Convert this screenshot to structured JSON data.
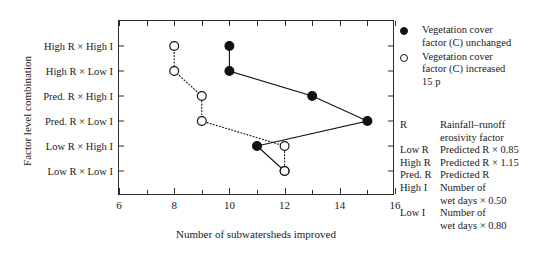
{
  "chart_data": {
    "type": "scatter",
    "title": "",
    "xlabel": "Number of subwatersheds improved",
    "ylabel": "Factor level combination",
    "xlim": [
      6,
      16
    ],
    "xticks": [
      6,
      8,
      10,
      12,
      14,
      16
    ],
    "xtick_labels": [
      "6",
      "8",
      "10",
      "12",
      "14",
      "16"
    ],
    "xminor_step": 1,
    "grid": false,
    "legend_position": "right",
    "categories": [
      "High R × High I",
      "High R × Low I",
      "Pred. R × High I",
      "Pred. R × Low I",
      "Low R × High I",
      "Low R × Low I"
    ],
    "series": [
      {
        "name": "Vegetation cover factor (C) unchanged",
        "marker": "filled-circle",
        "line": "solid",
        "color": "#111111",
        "values": [
          10,
          10,
          13,
          15,
          11,
          12
        ]
      },
      {
        "name": "Vegetation cover factor (C) increased 15 p",
        "marker": "open-circle",
        "line": "dotted",
        "color": "#111111",
        "values": [
          8,
          8,
          9,
          9,
          12,
          12
        ]
      }
    ]
  },
  "axes": {
    "y_title": "Factor level combination",
    "x_title": "Number of subwatersheds improved",
    "y_categories": [
      "High R × High I",
      "High R × Low I",
      "Pred. R × High I",
      "Pred. R × Low I",
      "Low R × High I",
      "Low R × Low I"
    ],
    "x_tick_labels": [
      "6",
      "8",
      "10",
      "12",
      "14",
      "16"
    ]
  },
  "legend": {
    "items": [
      {
        "marker": "filled-circle",
        "lines": [
          "Vegetation cover",
          "factor (C) unchanged"
        ]
      },
      {
        "marker": "open-circle",
        "lines": [
          "Vegetation cover",
          "factor (C) increased",
          "15 p"
        ]
      }
    ]
  },
  "abbreviations": [
    {
      "key": "R",
      "lines": [
        "Rainfall–runoff",
        "erosivity factor"
      ]
    },
    {
      "key": "Low R",
      "lines": [
        "Predicted R × 0.85"
      ]
    },
    {
      "key": "High R",
      "lines": [
        "Predicted R × 1.15"
      ]
    },
    {
      "key": "Pred. R",
      "lines": [
        "Predicted R"
      ]
    },
    {
      "key": "High I",
      "lines": [
        "Number of",
        "wet days × 0.50"
      ]
    },
    {
      "key": "Low I",
      "lines": [
        "Number of",
        "wet days × 0.80"
      ]
    }
  ],
  "colors": {
    "axis": "#2b2b2b",
    "marker": "#111111",
    "background": "#ffffff"
  }
}
